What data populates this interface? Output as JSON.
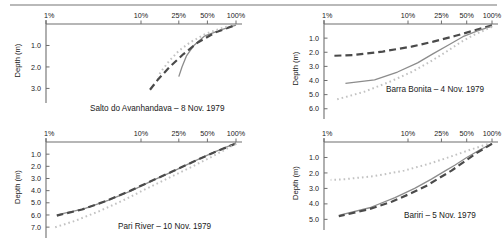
{
  "figure": {
    "axis_title_y": "Depth (m)",
    "x_tick_labels": [
      "1%",
      "10%",
      "25%",
      "50%",
      "100%"
    ],
    "x_tick_values": [
      1,
      10,
      25,
      50,
      100
    ],
    "colors": {
      "solid": "#8c8c8c",
      "dashed": "#4a4a4a",
      "dotted": "#c2c2c2",
      "axis": "#6e6e6e",
      "text": "#1a1a1a",
      "rule": "#b9b9b9"
    }
  },
  "chart_data": [
    {
      "type": "line",
      "panel": "top-left",
      "title": "Salto do Avanhandava – 8 Nov. 1979",
      "xlabel": "",
      "ylabel": "Depth (m)",
      "xscale": "log",
      "xlim": [
        1,
        100
      ],
      "ylim": [
        0,
        3.4
      ],
      "y_ticks": [
        1.0,
        2.0,
        3.0
      ],
      "y_tick_labels": [
        "1.0",
        "2.0",
        "3.0"
      ],
      "x_ticks": [
        1,
        10,
        25,
        50,
        100
      ],
      "x_tick_labels": [
        "1%",
        "10%",
        "25%",
        "50%",
        "100%"
      ],
      "grid": false,
      "legend": "none",
      "series": [
        {
          "name": "solid",
          "style": "solid",
          "color": "#8c8c8c",
          "points": [
            [
              100,
              0.05
            ],
            [
              72,
              0.25
            ],
            [
              47,
              0.55
            ],
            [
              36,
              1.0
            ],
            [
              30,
              1.5
            ],
            [
              27,
              2.0
            ],
            [
              25,
              2.45
            ]
          ]
        },
        {
          "name": "dashed",
          "style": "dashed",
          "color": "#4a4a4a",
          "points": [
            [
              92,
              0.1
            ],
            [
              60,
              0.4
            ],
            [
              40,
              0.85
            ],
            [
              28,
              1.4
            ],
            [
              20,
              2.0
            ],
            [
              15,
              2.6
            ],
            [
              12,
              3.15
            ]
          ]
        },
        {
          "name": "dotted",
          "style": "dotted",
          "color": "#c2c2c2",
          "points": [
            [
              80,
              0.12
            ],
            [
              48,
              0.45
            ],
            [
              33,
              0.85
            ],
            [
              25,
              1.25
            ],
            [
              20,
              1.7
            ],
            [
              17,
              2.1
            ],
            [
              15,
              2.45
            ]
          ]
        }
      ]
    },
    {
      "type": "line",
      "panel": "top-right",
      "title": "Barra Bonita – 4 Nov. 1979",
      "xlabel": "",
      "ylabel": "Depth (m)",
      "xscale": "log",
      "xlim": [
        1,
        100
      ],
      "ylim": [
        0,
        6.3
      ],
      "y_ticks": [
        1.0,
        2.0,
        3.0,
        4.0,
        5.0,
        6.0
      ],
      "y_tick_labels": [
        "1.0",
        "2.0",
        "3.0",
        "4.0",
        "5.0",
        "6.0"
      ],
      "x_ticks": [
        1,
        10,
        25,
        50,
        100
      ],
      "x_tick_labels": [
        "1%",
        "10%",
        "25%",
        "50%",
        "100%"
      ],
      "grid": false,
      "legend": "none",
      "series": [
        {
          "name": "dashed",
          "style": "dashed",
          "color": "#4a4a4a",
          "points": [
            [
              100,
              0.1
            ],
            [
              62,
              0.45
            ],
            [
              36,
              0.85
            ],
            [
              20,
              1.25
            ],
            [
              11,
              1.6
            ],
            [
              5,
              1.95
            ],
            [
              2.2,
              2.2
            ],
            [
              1.3,
              2.25
            ]
          ]
        },
        {
          "name": "solid",
          "style": "solid",
          "color": "#8c8c8c",
          "points": [
            [
              100,
              0.15
            ],
            [
              66,
              0.5
            ],
            [
              45,
              0.9
            ],
            [
              30,
              1.5
            ],
            [
              20,
              2.1
            ],
            [
              13,
              2.75
            ],
            [
              7.5,
              3.4
            ],
            [
              4,
              3.95
            ],
            [
              1.8,
              4.2
            ]
          ]
        },
        {
          "name": "dotted",
          "style": "dotted",
          "color": "#c2c2c2",
          "points": [
            [
              100,
              0.2
            ],
            [
              62,
              0.75
            ],
            [
              42,
              1.3
            ],
            [
              28,
              2.0
            ],
            [
              18,
              2.7
            ],
            [
              11,
              3.4
            ],
            [
              6,
              4.1
            ],
            [
              3,
              4.8
            ],
            [
              1.4,
              5.35
            ]
          ]
        }
      ]
    },
    {
      "type": "line",
      "panel": "bottom-left",
      "title": "Pari River – 10 Nov. 1979",
      "xlabel": "",
      "ylabel": "Depth (m)",
      "xscale": "log",
      "xlim": [
        1,
        100
      ],
      "ylim": [
        0,
        7.4
      ],
      "y_ticks": [
        1.0,
        2.0,
        3.0,
        4.0,
        5.0,
        6.0,
        7.0
      ],
      "y_tick_labels": [
        "1.0",
        "2.0",
        "3.0",
        "4.0",
        "5.0",
        "6.0",
        "7.0"
      ],
      "x_ticks": [
        1,
        10,
        25,
        50,
        100
      ],
      "x_tick_labels": [
        "1%",
        "10%",
        "25%",
        "50%",
        "100%"
      ],
      "grid": false,
      "legend": "none",
      "series": [
        {
          "name": "solid",
          "style": "solid",
          "color": "#8c8c8c",
          "points": [
            [
              100,
              0.1
            ],
            [
              58,
              0.85
            ],
            [
              36,
              1.6
            ],
            [
              22,
              2.4
            ],
            [
              13,
              3.2
            ],
            [
              8,
              4.0
            ],
            [
              4.5,
              4.8
            ],
            [
              2.5,
              5.5
            ],
            [
              1.3,
              6.0
            ]
          ]
        },
        {
          "name": "dashed",
          "style": "dashed",
          "color": "#4a4a4a",
          "points": [
            [
              100,
              0.12
            ],
            [
              57,
              0.9
            ],
            [
              35,
              1.65
            ],
            [
              21,
              2.45
            ],
            [
              12.5,
              3.25
            ],
            [
              7.5,
              4.05
            ],
            [
              4.3,
              4.85
            ],
            [
              2.4,
              5.55
            ],
            [
              1.3,
              6.05
            ]
          ]
        },
        {
          "name": "dotted",
          "style": "dotted",
          "color": "#c2c2c2",
          "points": [
            [
              100,
              0.15
            ],
            [
              56,
              1.2
            ],
            [
              33,
              2.1
            ],
            [
              19,
              3.0
            ],
            [
              11,
              3.9
            ],
            [
              6.5,
              4.8
            ],
            [
              3.6,
              5.7
            ],
            [
              2,
              6.5
            ],
            [
              1.2,
              7.05
            ]
          ]
        }
      ]
    },
    {
      "type": "line",
      "panel": "bottom-right",
      "title": "Bariri – 5 Nov. 1979",
      "xlabel": "",
      "ylabel": "Depth (m)",
      "xscale": "log",
      "xlim": [
        1,
        100
      ],
      "ylim": [
        0,
        5.3
      ],
      "y_ticks": [
        1.0,
        2.0,
        3.0,
        4.0,
        5.0
      ],
      "y_tick_labels": [
        "1.0",
        "2.0",
        "3.0",
        "4.0",
        "5.0"
      ],
      "x_ticks": [
        1,
        10,
        25,
        50,
        100
      ],
      "x_tick_labels": [
        "1%",
        "10%",
        "25%",
        "50%",
        "100%"
      ],
      "grid": false,
      "legend": "none",
      "series": [
        {
          "name": "dotted",
          "style": "dotted",
          "color": "#c2c2c2",
          "points": [
            [
              100,
              0.05
            ],
            [
              55,
              0.5
            ],
            [
              32,
              0.95
            ],
            [
              18,
              1.4
            ],
            [
              9,
              1.85
            ],
            [
              4,
              2.2
            ],
            [
              1.8,
              2.4
            ],
            [
              1.2,
              2.45
            ]
          ]
        },
        {
          "name": "solid",
          "style": "solid",
          "color": "#8c8c8c",
          "points": [
            [
              100,
              0.1
            ],
            [
              72,
              0.5
            ],
            [
              50,
              1.0
            ],
            [
              36,
              1.5
            ],
            [
              28,
              1.85
            ],
            [
              19,
              2.4
            ],
            [
              12,
              3.0
            ],
            [
              7,
              3.6
            ],
            [
              3.5,
              4.25
            ],
            [
              1.5,
              4.75
            ]
          ]
        },
        {
          "name": "dashed",
          "style": "dashed",
          "color": "#4a4a4a",
          "points": [
            [
              100,
              0.12
            ],
            [
              66,
              0.7
            ],
            [
              46,
              1.3
            ],
            [
              33,
              1.85
            ],
            [
              24,
              2.3
            ],
            [
              17,
              2.8
            ],
            [
              11,
              3.3
            ],
            [
              6.5,
              3.85
            ],
            [
              3.4,
              4.35
            ],
            [
              1.5,
              4.8
            ]
          ]
        }
      ]
    }
  ]
}
